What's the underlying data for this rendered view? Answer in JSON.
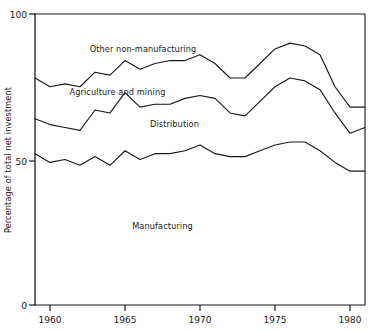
{
  "chart_data": {
    "type": "area",
    "title": "",
    "subtitle": "",
    "xlabel": "",
    "ylabel": "Percentage of total net investment",
    "xlim": [
      1959,
      1981
    ],
    "ylim": [
      0,
      100
    ],
    "grid": false,
    "legend_position": "inline-annotations",
    "x_ticks": [
      "1960",
      "1965",
      "1970",
      "1975",
      "1980"
    ],
    "x_tick_values": [
      1960,
      1965,
      1970,
      1975,
      1980
    ],
    "y_ticks": [
      "0",
      "50",
      "100"
    ],
    "y_tick_values": [
      0,
      50,
      100
    ],
    "x": [
      1959,
      1960,
      1961,
      1962,
      1963,
      1964,
      1965,
      1966,
      1967,
      1968,
      1969,
      1970,
      1971,
      1972,
      1973,
      1974,
      1975,
      1976,
      1977,
      1978,
      1979,
      1980,
      1981
    ],
    "stacking": "cumulative-from-bottom",
    "series": [
      {
        "name": "Manufacturing",
        "label_position": {
          "x": 1967.5,
          "y": 26
        },
        "values": [
          52,
          49,
          50,
          48,
          51,
          48,
          53,
          50,
          52,
          52,
          53,
          55,
          52,
          51,
          51,
          53,
          55,
          56,
          56,
          53,
          49,
          46,
          46
        ]
      },
      {
        "name": "Distribution",
        "label_position": {
          "x": 1968.3,
          "y": 61
        },
        "values": [
          12,
          13,
          11,
          12,
          16,
          18,
          20,
          18,
          17,
          17,
          18,
          17,
          19,
          15,
          14,
          17,
          20,
          22,
          21,
          21,
          17,
          13,
          15
        ]
      },
      {
        "name": "Agriculture and mining",
        "label_position": {
          "x": 1964.5,
          "y": 72
        },
        "values": [
          14,
          13,
          15,
          15,
          13,
          13,
          11,
          13,
          14,
          15,
          13,
          14,
          12,
          12,
          13,
          13,
          13,
          12,
          12,
          12,
          9,
          9,
          7
        ]
      },
      {
        "name": "Other non-manufacturing",
        "label_position": {
          "x": 1966.2,
          "y": 87
        },
        "values": [
          22,
          25,
          24,
          25,
          20,
          21,
          16,
          19,
          17,
          16,
          16,
          14,
          17,
          22,
          22,
          17,
          12,
          10,
          11,
          14,
          25,
          32,
          32
        ]
      }
    ],
    "boundary_lines": [
      {
        "name": "manufacturing-top",
        "cumulative_values": [
          52,
          49,
          50,
          48,
          51,
          48,
          53,
          50,
          52,
          52,
          53,
          55,
          52,
          51,
          51,
          53,
          55,
          56,
          56,
          53,
          49,
          46,
          46
        ]
      },
      {
        "name": "distribution-top",
        "cumulative_values": [
          64,
          62,
          61,
          60,
          67,
          66,
          73,
          68,
          69,
          69,
          71,
          72,
          71,
          66,
          65,
          70,
          75,
          78,
          77,
          74,
          66,
          59,
          61
        ]
      },
      {
        "name": "agriculture-and-mining-top",
        "cumulative_values": [
          78,
          75,
          76,
          75,
          80,
          79,
          84,
          81,
          83,
          84,
          84,
          86,
          83,
          78,
          78,
          83,
          88,
          90,
          89,
          86,
          75,
          68,
          68
        ]
      }
    ],
    "annotations": [
      {
        "text": "Other non-manufacturing",
        "x": 1966.2,
        "y": 87
      },
      {
        "text": "Agriculture and mining",
        "x": 1964.5,
        "y": 72
      },
      {
        "text": "Distribution",
        "x": 1968.3,
        "y": 61
      },
      {
        "text": "Manufacturing",
        "x": 1967.5,
        "y": 26
      }
    ],
    "colors": {
      "line": "#1a1a1a",
      "axis": "#1a1a1a",
      "background": "#ffffff",
      "text": "#1a1a1a"
    }
  },
  "axes": {
    "y_axis_title": "Percentage of total net investment",
    "y_tick_labels": [
      "100",
      "50",
      "0"
    ],
    "x_tick_labels": [
      "1960",
      "1965",
      "1970",
      "1975",
      "1980"
    ]
  },
  "labels": {
    "other_non_manufacturing": "Other non-manufacturing",
    "agriculture_and_mining": "Agriculture and mining",
    "distribution": "Distribution",
    "manufacturing": "Manufacturing"
  }
}
